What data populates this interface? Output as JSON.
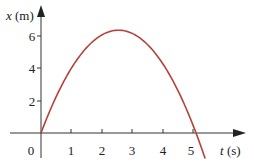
{
  "chart_data": {
    "type": "line",
    "title": "",
    "xlabel": "t (s)",
    "ylabel": "x (m)",
    "xlabel_var": "t",
    "xlabel_unit": "(s)",
    "ylabel_var": "x",
    "ylabel_unit": "(m)",
    "x_ticks": [
      "0",
      "1",
      "2",
      "3",
      "4",
      "5"
    ],
    "y_ticks": [
      "2",
      "4",
      "6"
    ],
    "xlim": [
      -1.2,
      7
    ],
    "ylim": [
      -1.4,
      7.5
    ],
    "grid": false,
    "series": [
      {
        "name": "x(t)",
        "color": "#b5413a",
        "x": [
          0,
          0.5,
          1,
          1.5,
          2,
          2.4,
          3,
          3.5,
          4,
          4.5,
          5,
          5.1,
          5.4
        ],
        "y": [
          0,
          2.2,
          3.97,
          5.24,
          6.01,
          6.29,
          6.11,
          5.43,
          4.27,
          2.62,
          0.49,
          0.0,
          -1.57
        ]
      }
    ],
    "curve_color": "#b5413a",
    "axis_color": "#333333"
  }
}
